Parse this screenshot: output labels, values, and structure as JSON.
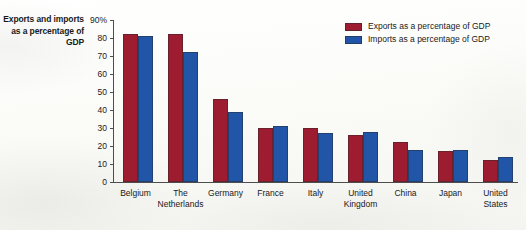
{
  "chart_data": {
    "type": "bar",
    "title": "",
    "xlabel": "",
    "ylabel": "Exports and imports as a percentage of GDP",
    "ylim": [
      0,
      90
    ],
    "ytick_values": [
      0,
      10,
      20,
      30,
      40,
      50,
      60,
      70,
      80,
      90
    ],
    "ytick_labels": [
      "0",
      "10",
      "20",
      "30",
      "40",
      "50",
      "60",
      "70",
      "80",
      "90%"
    ],
    "grid": false,
    "legend_position": "top-right",
    "categories": [
      "Belgium",
      "The\nNetherlands",
      "Germany",
      "France",
      "Italy",
      "United\nKingdom",
      "China",
      "Japan",
      "United\nStates"
    ],
    "series": [
      {
        "name": "Exports as a percentage of GDP",
        "color": "#9E1C2F",
        "values": [
          82,
          82,
          46,
          30,
          30,
          26,
          22,
          17,
          12
        ]
      },
      {
        "name": "Imports as a percentage of GDP",
        "color": "#2155A8",
        "values": [
          81,
          72,
          39,
          31,
          27,
          28,
          18,
          18,
          14
        ]
      }
    ]
  }
}
